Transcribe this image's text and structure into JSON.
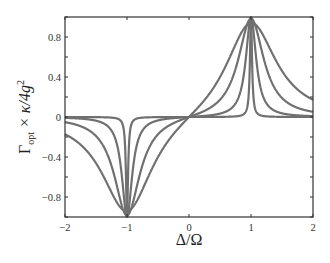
{
  "chart_data": {
    "type": "line",
    "title": "",
    "xlabel": "Δ/Ω",
    "ylabel": "Γ_opt × κ/4g²",
    "xlim": [
      -2,
      2
    ],
    "ylim": [
      -1,
      1
    ],
    "x_ticks": [
      "-2",
      "-1",
      "0",
      "1",
      "2"
    ],
    "y_ticks": [
      "0.8",
      "0.4",
      "0",
      "-0.4",
      "-0.8"
    ],
    "grid": false,
    "legend": null,
    "series_formula": "f(Δ) = γ²/((Δ-1)²+γ²) − γ²/((Δ+1)²+γ²)",
    "series": [
      {
        "name": "narrowest",
        "width": 0.02
      },
      {
        "name": "narrow",
        "width": 0.1
      },
      {
        "name": "medium",
        "width": 0.25
      },
      {
        "name": "wide",
        "width": 0.5
      }
    ],
    "line_color": "#707070"
  },
  "axes": {
    "xlabel_main": "Δ/Ω",
    "ylabel_main": "Γ",
    "ylabel_sub": "opt",
    "ylabel_rest": " × κ/4g",
    "ylabel_sup": "2"
  }
}
